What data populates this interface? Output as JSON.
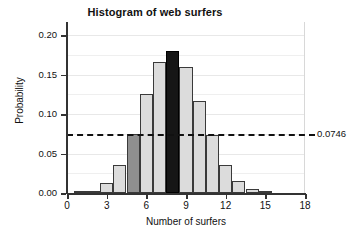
{
  "chart_data": {
    "type": "bar",
    "title": "Histogram of web surfers",
    "xlabel": "Number of surfers",
    "ylabel": "Probability",
    "categories": [
      0,
      1,
      2,
      3,
      4,
      5,
      6,
      7,
      8,
      9,
      10,
      11,
      12,
      13,
      14,
      15,
      16,
      17,
      18
    ],
    "values": [
      0.0,
      0.001,
      0.003,
      0.013,
      0.036,
      0.0746,
      0.125,
      0.166,
      0.18,
      0.16,
      0.117,
      0.073,
      0.036,
      0.015,
      0.005,
      0.001,
      0.0,
      0.0,
      0.0
    ],
    "bar_styles": [
      "light",
      "light",
      "light",
      "light",
      "light",
      "medium",
      "light",
      "light",
      "dark",
      "light",
      "light",
      "light",
      "light",
      "light",
      "light",
      "light",
      "light",
      "light",
      "light"
    ],
    "xlim": [
      0,
      18
    ],
    "ylim": [
      0,
      0.2167
    ],
    "xticks": [
      "0",
      "3",
      "6",
      "9",
      "12",
      "15",
      "18"
    ],
    "xtick_values": [
      0,
      3,
      6,
      9,
      12,
      15,
      18
    ],
    "yticks": [
      "0.00",
      "0.05",
      "0.10",
      "0.15",
      "0.20"
    ],
    "ytick_values": [
      0.0,
      0.05,
      0.1,
      0.15,
      0.2
    ],
    "gridlines": true,
    "gridline_values": [
      0.025,
      0.05,
      0.075,
      0.1,
      0.125,
      0.15,
      0.175,
      0.2
    ],
    "legend": null,
    "annotations": [
      {
        "type": "horizontal-reference-line",
        "label": "0.0746",
        "value": 0.0746,
        "style": "dashed",
        "color": "#111111"
      }
    ],
    "colors": {
      "bar_light": "#dcdcdc",
      "bar_medium": "#8f8f8f",
      "bar_dark": "#161616",
      "bar_outline": "#3a3a3a",
      "axis": "#333333",
      "grid": "#efefef",
      "text": "#111111",
      "background": "#ffffff"
    }
  }
}
